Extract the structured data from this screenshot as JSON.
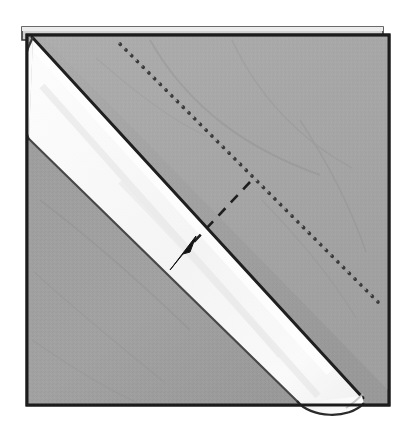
{
  "figure": {
    "caption": "Square sheet folded on the diagonal with a rolled white band running from the upper-left corner to the lower-right corner; a dotted guide line marks the next fold and an arrow shows the rolling direction.",
    "medium": "halftone line illustration",
    "background_color": "#ffffff"
  },
  "colors": {
    "paper_gray": "#9d9d9d",
    "paper_gray_light": "#aaaaaa",
    "paper_gray_dark": "#8d8d8d",
    "band_white": "#f9f9f9",
    "band_shade": "#e6e6e6",
    "outline": "#2b2b2b",
    "outline_soft": "#5a5a5a",
    "dot_color": "#3a3a3a",
    "arrow_color": "#151515",
    "background": "#ffffff"
  },
  "shapes": {
    "under_sheet": {
      "name": "under-sheet-edge",
      "points": "22,28 382,28 382,36 28,36",
      "fill": "#c9c9c9",
      "stroke": "#2b2b2b"
    },
    "main_square": {
      "name": "napkin-square",
      "points": "27,36 388,36 388,404 27,404",
      "fill": "#9d9d9d",
      "stroke": "#1f1f1f",
      "stroke_width": 3
    },
    "upper_triangle": {
      "name": "upper-gray-triangle",
      "points": "48,38 388,38 388,380",
      "fill": "#a6a6a6"
    },
    "lower_triangle": {
      "name": "lower-gray-triangle",
      "points": "29,142 29,402 300,402",
      "fill": "#9a9a9a"
    },
    "white_band": {
      "name": "white-rolled-band",
      "top_start": [
        32,
        38
      ],
      "top_end": [
        360,
        396
      ],
      "bottom_start": [
        29,
        140
      ],
      "bottom_end": [
        300,
        404
      ],
      "fill": "#f9f9f9",
      "stroke": "#2b2b2b"
    },
    "band_top_cap": {
      "name": "band-top-rolled-cap",
      "description": "rounded open end of the roll at the upper-left corner",
      "fill": "#f4f4f4"
    },
    "band_bottom_cap": {
      "name": "band-bottom-rolled-cap",
      "description": "rounded open end of the roll protruding past the lower-right edge",
      "center": [
        330,
        395
      ],
      "fill": "#f5f5f5"
    }
  },
  "annotations": {
    "dotted_fold_line": {
      "name": "dotted-fold-guide-line",
      "label": "fold guide (dotted)",
      "start": [
        120,
        44
      ],
      "end": [
        378,
        302
      ],
      "style": "dotted",
      "dot_count": 34,
      "color": "#3a3a3a"
    },
    "dashed_motion_line": {
      "name": "dashed-motion-line",
      "label": "roll direction (dashed)",
      "start": [
        248,
        184
      ],
      "end": [
        186,
        250
      ],
      "style": "dashed",
      "dash_pattern": "9 7",
      "color": "#202020"
    },
    "arrow": {
      "name": "fold-direction-arrow",
      "label": "roll toward lower left",
      "tip": [
        172,
        268
      ],
      "tail": [
        196,
        240
      ],
      "direction": "down-left",
      "color": "#151515"
    }
  },
  "legend": {
    "items": [
      {
        "key": "dotted",
        "label": "Next fold line"
      },
      {
        "key": "dashed_arrow",
        "label": "Roll in this direction"
      },
      {
        "key": "gray",
        "label": "Napkin face"
      },
      {
        "key": "white",
        "label": "Rolled edge"
      }
    ]
  }
}
